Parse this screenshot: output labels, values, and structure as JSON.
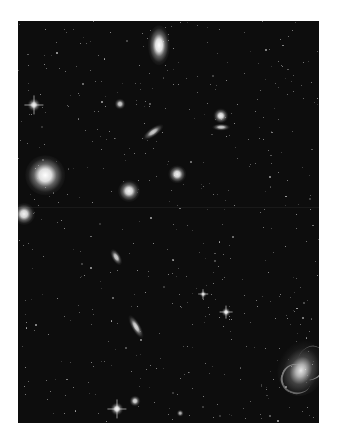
{
  "image": {
    "subject": "deep-sky star field with galaxies",
    "background_color": "#0d0d0d",
    "frame": {
      "x": 18,
      "y": 21,
      "width": 301,
      "height": 402
    }
  },
  "objects": [
    {
      "name": "elliptical-galaxy-top",
      "x": 141,
      "y": 24,
      "w": 10,
      "h": 18,
      "rot": 0,
      "brightness": 1.0
    },
    {
      "name": "bright-star-left",
      "x": 16,
      "y": 84,
      "w": 6,
      "h": 6,
      "rot": 0,
      "brightness": 0.9,
      "spikes": true
    },
    {
      "name": "small-galaxy-upper",
      "x": 102,
      "y": 83,
      "w": 5,
      "h": 5,
      "rot": 0,
      "brightness": 0.8
    },
    {
      "name": "edge-on-galaxy-center",
      "x": 135,
      "y": 111,
      "w": 4,
      "h": 11,
      "rot": 55,
      "brightness": 0.8
    },
    {
      "name": "galaxy-pair-upper-right-a",
      "x": 203,
      "y": 95,
      "w": 7,
      "h": 7,
      "rot": 0,
      "brightness": 0.95
    },
    {
      "name": "galaxy-pair-upper-right-b",
      "x": 203,
      "y": 106,
      "w": 8,
      "h": 3,
      "rot": 0,
      "brightness": 0.8
    },
    {
      "name": "giant-elliptical-left",
      "x": 27,
      "y": 154,
      "w": 18,
      "h": 18,
      "rot": 0,
      "brightness": 1.0
    },
    {
      "name": "elliptical-galaxy-mid",
      "x": 159,
      "y": 153,
      "w": 8,
      "h": 8,
      "rot": 0,
      "brightness": 0.95
    },
    {
      "name": "elliptical-galaxy-center",
      "x": 111,
      "y": 170,
      "w": 10,
      "h": 10,
      "rot": 0,
      "brightness": 0.95
    },
    {
      "name": "galaxy-left-edge",
      "x": 6,
      "y": 193,
      "w": 10,
      "h": 10,
      "rot": 0,
      "brightness": 0.95
    },
    {
      "name": "small-galaxy-lower",
      "x": 98,
      "y": 236,
      "w": 4,
      "h": 8,
      "rot": -30,
      "brightness": 0.8
    },
    {
      "name": "star-spiked-mid-right",
      "x": 208,
      "y": 291,
      "w": 4,
      "h": 4,
      "rot": 0,
      "brightness": 0.9,
      "spikes": true
    },
    {
      "name": "star-mid",
      "x": 185,
      "y": 273,
      "w": 3,
      "h": 3,
      "rot": 0,
      "brightness": 0.8,
      "spikes": true
    },
    {
      "name": "edge-on-galaxy-lower",
      "x": 118,
      "y": 306,
      "w": 4,
      "h": 12,
      "rot": -30,
      "brightness": 0.85
    },
    {
      "name": "spiral-galaxy-lower-right",
      "x": 284,
      "y": 347,
      "w": 22,
      "h": 26,
      "rot": 20,
      "brightness": 0.9,
      "spiral": true
    },
    {
      "name": "bright-star-bottom",
      "x": 99,
      "y": 388,
      "w": 6,
      "h": 6,
      "rot": 0,
      "brightness": 0.95,
      "spikes": true
    },
    {
      "name": "star-bottom",
      "x": 117,
      "y": 380,
      "w": 5,
      "h": 5,
      "rot": 0,
      "brightness": 0.85
    },
    {
      "name": "star-bottom-right",
      "x": 162,
      "y": 392,
      "w": 3,
      "h": 3,
      "rot": 0,
      "brightness": 0.7
    }
  ],
  "star_field": {
    "count": 520,
    "seed": 7
  }
}
